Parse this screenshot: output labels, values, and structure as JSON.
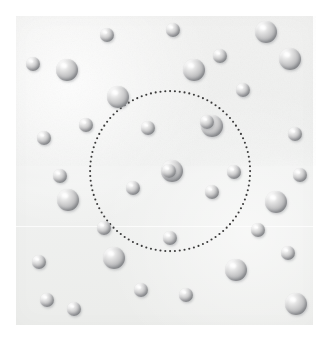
{
  "figure": {
    "canvas": {
      "width": 325,
      "height": 341,
      "background_color": "#ffffff"
    },
    "panel": {
      "label": "particle-field",
      "x": 16,
      "y": 16,
      "width": 297,
      "height": 309,
      "fill_color": "#eff0ef",
      "seam_y": 226
    },
    "boundary_circle": {
      "label": "sampling-region",
      "center_x": 170,
      "center_y": 171,
      "radius": 80,
      "style": "dotted",
      "dot_color": "#3b3b3b",
      "dot_diameter": 2.1,
      "dot_count": 104
    },
    "sphere_style": {
      "highlight_color": "#ffffff",
      "midtone_color": "#c9c9ca",
      "shadow_color": "#8d9094",
      "large_diameter": 22,
      "small_diameter": 14
    },
    "legend": {
      "large_particle_label": "large particle",
      "small_particle_label": "small particle",
      "boundary_label": "region boundary"
    },
    "counts": {
      "total_spheres": 37,
      "inside_circle": 7,
      "outside_circle": 30,
      "large_spheres": 18,
      "small_spheres": 19
    },
    "spheres": [
      {
        "id": "s01",
        "cx": 107,
        "cy": 35,
        "d": 14,
        "size": "small",
        "inside": false
      },
      {
        "id": "s02",
        "cx": 173,
        "cy": 30,
        "d": 14,
        "size": "small",
        "inside": false
      },
      {
        "id": "s03",
        "cx": 266,
        "cy": 32,
        "d": 22,
        "size": "large",
        "inside": false
      },
      {
        "id": "s04",
        "cx": 290,
        "cy": 59,
        "d": 22,
        "size": "large",
        "inside": false
      },
      {
        "id": "s05",
        "cx": 33,
        "cy": 64,
        "d": 14,
        "size": "small",
        "inside": false
      },
      {
        "id": "s06",
        "cx": 67,
        "cy": 70,
        "d": 22,
        "size": "large",
        "inside": false
      },
      {
        "id": "s07",
        "cx": 194,
        "cy": 70,
        "d": 22,
        "size": "large",
        "inside": false
      },
      {
        "id": "s08",
        "cx": 118,
        "cy": 97,
        "d": 22,
        "size": "large",
        "inside": false
      },
      {
        "id": "s09",
        "cx": 243,
        "cy": 90,
        "d": 14,
        "size": "small",
        "inside": false
      },
      {
        "id": "s10",
        "cx": 44,
        "cy": 138,
        "d": 14,
        "size": "small",
        "inside": false
      },
      {
        "id": "s11",
        "cx": 148,
        "cy": 128,
        "d": 14,
        "size": "small",
        "inside": true
      },
      {
        "id": "s12",
        "cx": 212,
        "cy": 126,
        "d": 22,
        "size": "large",
        "inside": true
      },
      {
        "id": "s13",
        "cx": 295,
        "cy": 134,
        "d": 14,
        "size": "small",
        "inside": false
      },
      {
        "id": "s14",
        "cx": 172,
        "cy": 171,
        "d": 22,
        "size": "large",
        "inside": true
      },
      {
        "id": "s15",
        "cx": 133,
        "cy": 188,
        "d": 14,
        "size": "small",
        "inside": true
      },
      {
        "id": "s16",
        "cx": 212,
        "cy": 192,
        "d": 14,
        "size": "small",
        "inside": true
      },
      {
        "id": "s17",
        "cx": 68,
        "cy": 200,
        "d": 22,
        "size": "large",
        "inside": false
      },
      {
        "id": "s18",
        "cx": 276,
        "cy": 202,
        "d": 22,
        "size": "large",
        "inside": false
      },
      {
        "id": "s19",
        "cx": 170,
        "cy": 238,
        "d": 14,
        "size": "small",
        "inside": true
      },
      {
        "id": "s20",
        "cx": 39,
        "cy": 262,
        "d": 14,
        "size": "small",
        "inside": false
      },
      {
        "id": "s21",
        "cx": 114,
        "cy": 258,
        "d": 22,
        "size": "large",
        "inside": false
      },
      {
        "id": "s22",
        "cx": 288,
        "cy": 253,
        "d": 14,
        "size": "small",
        "inside": false
      },
      {
        "id": "s23",
        "cx": 236,
        "cy": 270,
        "d": 22,
        "size": "large",
        "inside": false
      },
      {
        "id": "s24",
        "cx": 186,
        "cy": 295,
        "d": 14,
        "size": "small",
        "inside": false
      },
      {
        "id": "s25",
        "cx": 74,
        "cy": 309,
        "d": 14,
        "size": "small",
        "inside": false
      },
      {
        "id": "s26",
        "cx": 296,
        "cy": 304,
        "d": 22,
        "size": "large",
        "inside": false
      },
      {
        "id": "s27",
        "cx": 234,
        "cy": 172,
        "d": 14,
        "size": "small",
        "inside": false
      },
      {
        "id": "s28",
        "cx": 169,
        "cy": 171,
        "d": 14,
        "size": "small",
        "inside": true
      },
      {
        "id": "s29",
        "cx": 104,
        "cy": 228,
        "d": 14,
        "size": "small",
        "inside": false
      },
      {
        "id": "s30",
        "cx": 258,
        "cy": 230,
        "d": 14,
        "size": "small",
        "inside": false
      },
      {
        "id": "s31",
        "cx": 207,
        "cy": 122,
        "d": 14,
        "size": "small",
        "inside": true
      },
      {
        "id": "s32",
        "cx": 60,
        "cy": 176,
        "d": 14,
        "size": "small",
        "inside": false
      },
      {
        "id": "s33",
        "cx": 220,
        "cy": 56,
        "d": 14,
        "size": "small",
        "inside": false
      },
      {
        "id": "s34",
        "cx": 141,
        "cy": 290,
        "d": 14,
        "size": "small",
        "inside": false
      },
      {
        "id": "s35",
        "cx": 86,
        "cy": 125,
        "d": 14,
        "size": "small",
        "inside": false
      },
      {
        "id": "s36",
        "cx": 300,
        "cy": 175,
        "d": 14,
        "size": "small",
        "inside": false
      },
      {
        "id": "s37",
        "cx": 47,
        "cy": 300,
        "d": 14,
        "size": "small",
        "inside": false
      }
    ]
  }
}
